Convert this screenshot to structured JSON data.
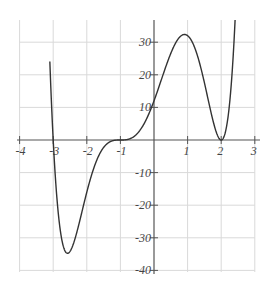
{
  "chart_data": {
    "type": "line",
    "title": "",
    "xlabel": "",
    "ylabel": "",
    "function": "f(x) = (x+3)(x+1)^3(x-2)^2",
    "xlim": [
      -4,
      3
    ],
    "ylim": [
      -40,
      36
    ],
    "grid": true,
    "x_ticks": [
      -4,
      -3,
      -2,
      -1,
      1,
      2,
      3
    ],
    "x_tick_labels": [
      "-4",
      "-3",
      "-2",
      "-1",
      "1",
      "2",
      "3"
    ],
    "y_ticks": [
      30,
      20,
      10,
      -10,
      -20,
      -30,
      -40
    ],
    "y_tick_labels": [
      "30",
      "20",
      "10",
      "-10",
      "-20",
      "-30",
      "-40"
    ],
    "series": [
      {
        "name": "f(x)",
        "x": [
          -3.05,
          -3,
          -2.9,
          -2.8,
          -2.7,
          -2.6,
          -2.5,
          -2.4,
          -2.2,
          -2.0,
          -1.8,
          -1.5,
          -1.2,
          -1,
          -0.5,
          0,
          0.5,
          1,
          1.5,
          2,
          2.3,
          2.4
        ],
        "y": [
          9.0,
          0,
          -16.47,
          -26.87,
          -32.56,
          -34.67,
          -34.17,
          -31.87,
          -24.39,
          -16,
          -8.87,
          -2.3,
          -0.15,
          0,
          1.95,
          12,
          26.58,
          32,
          17.58,
          0,
          17.14,
          30.4
        ]
      }
    ],
    "key_points": {
      "x_intercepts": [
        -3,
        -1,
        2
      ],
      "y_intercept": 12,
      "local_max": [
        1,
        32
      ],
      "local_min": [
        -2.6,
        -34.7
      ]
    }
  }
}
